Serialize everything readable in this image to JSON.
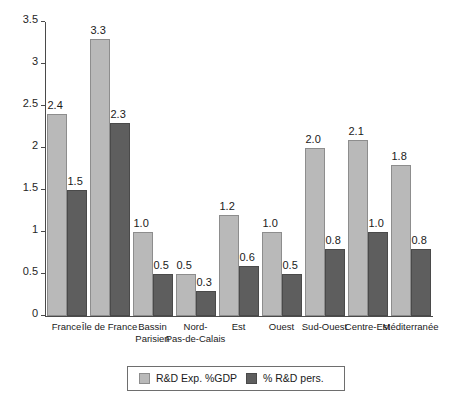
{
  "chart_data": {
    "type": "bar",
    "title": "",
    "subtitle": "",
    "xlabel": "",
    "ylabel": "",
    "ylim": [
      0,
      3.5
    ],
    "ytick_labels": [
      "0",
      "0.5",
      "1",
      "1.5",
      "2",
      "2.5",
      "3",
      "3.5"
    ],
    "ytick_values": [
      0,
      0.5,
      1,
      1.5,
      2,
      2.5,
      3,
      3.5
    ],
    "grid": false,
    "legend_position": "bottom",
    "categories": [
      "France",
      "Île de France",
      "Bassin\nParisien",
      "Nord-\nPas-de-Calais",
      "Est",
      "Ouest",
      "Sud-Ouest",
      "Centre-Est",
      "Méditerranée"
    ],
    "series": [
      {
        "name": "R&D Exp. %GDP",
        "color": "#b9b9b9",
        "values": [
          2.4,
          3.3,
          1.0,
          0.5,
          1.2,
          1.0,
          2.0,
          2.1,
          1.8
        ],
        "labels": [
          "2.4",
          "3.3",
          "1.0",
          "0.5",
          "1.2",
          "1.0",
          "2.0",
          "2.1",
          "1.8"
        ]
      },
      {
        "name": "% R&D pers.",
        "color": "#5e5e5e",
        "values": [
          1.5,
          2.3,
          0.5,
          0.3,
          0.6,
          0.5,
          0.8,
          1.0,
          0.8
        ],
        "labels": [
          "1.5",
          "2.3",
          "0.5",
          "0.3",
          "0.6",
          "0.5",
          "0.8",
          "1.0",
          "0.8"
        ]
      }
    ]
  },
  "legend": {
    "entries": [
      {
        "label": "R&D Exp. %GDP",
        "color": "#b9b9b9"
      },
      {
        "label": "% R&D pers.",
        "color": "#5e5e5e"
      }
    ]
  },
  "colors": {
    "series_light": "#b9b9b9",
    "series_dark": "#5e5e5e",
    "axis": "#4a4a4a",
    "background": "#ffffff"
  }
}
